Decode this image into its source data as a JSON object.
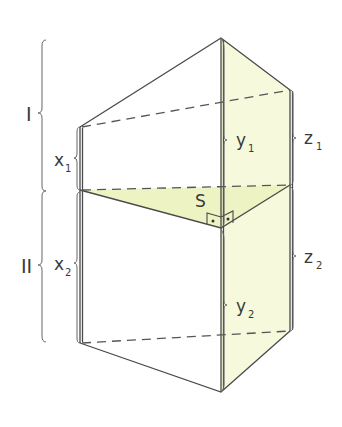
{
  "figure": {
    "labels": {
      "section_upper": "I",
      "section_lower": "II",
      "x1": "x",
      "x1_sub": "1",
      "x2": "x",
      "x2_sub": "2",
      "y1": "y",
      "y1_sub": "1",
      "y2": "y",
      "y2_sub": "2",
      "z1": "z",
      "z1_sub": "1",
      "z2": "z",
      "z2_sub": "2",
      "point_s": "S"
    },
    "colors": {
      "fill": "#f7f9dc",
      "fill_section": "#eef3c4",
      "edge": "#4a4a4a"
    }
  }
}
